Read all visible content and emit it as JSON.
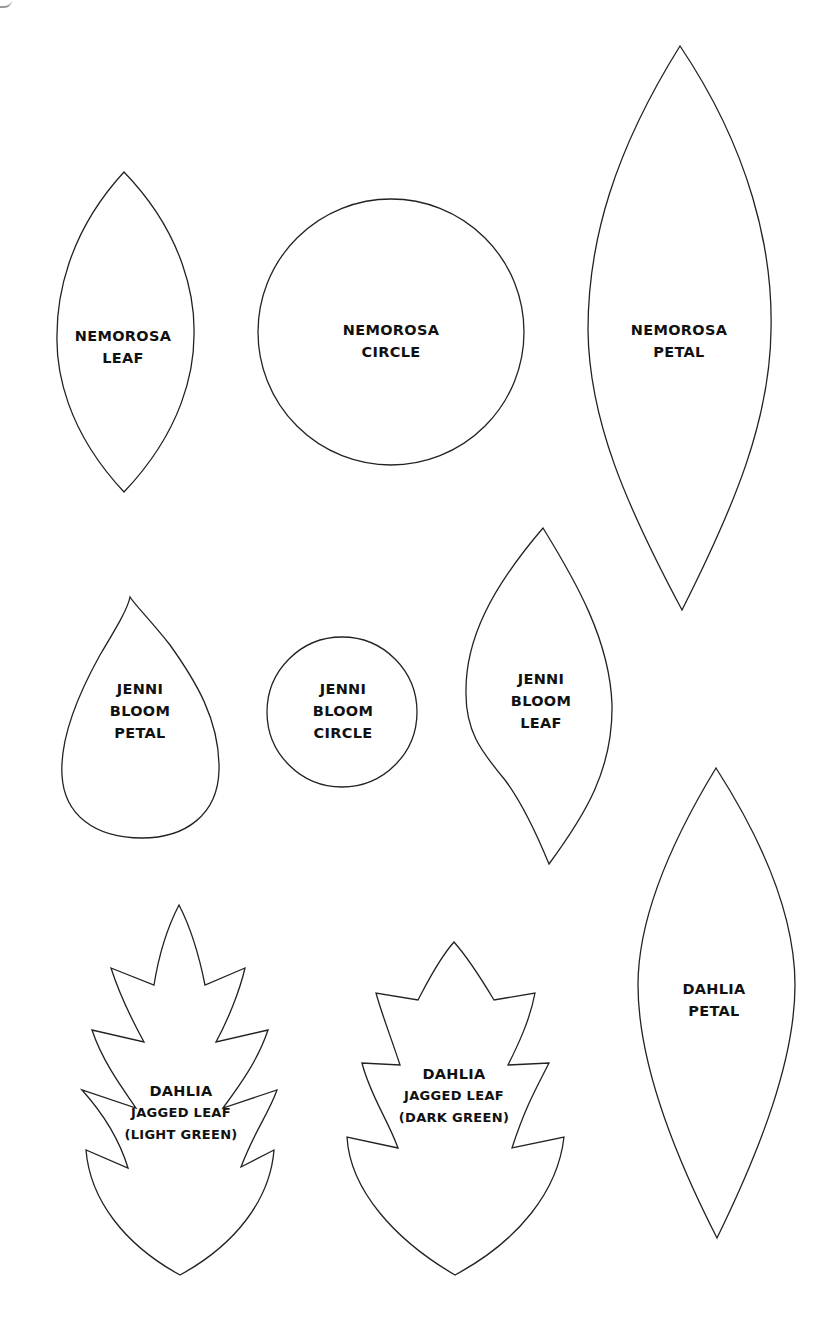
{
  "page": {
    "background": "#ffffff",
    "stroke_color": "#222222",
    "text_color": "#111111"
  },
  "templates": [
    {
      "id": "nemorosa-leaf",
      "shape": "pointed-oval",
      "lines": [
        "NEMOROSA",
        "LEAF"
      ]
    },
    {
      "id": "nemorosa-circle",
      "shape": "circle",
      "lines": [
        "NEMOROSA",
        "CIRCLE"
      ]
    },
    {
      "id": "nemorosa-petal",
      "shape": "pointed-oval",
      "lines": [
        "NEMOROSA",
        "PETAL"
      ]
    },
    {
      "id": "jenni-bloom-petal",
      "shape": "teardrop",
      "lines": [
        "JENNI",
        "BLOOM",
        "PETAL"
      ]
    },
    {
      "id": "jenni-bloom-circle",
      "shape": "circle",
      "lines": [
        "JENNI",
        "BLOOM",
        "CIRCLE"
      ]
    },
    {
      "id": "jenni-bloom-leaf",
      "shape": "asymmetric-leaf",
      "lines": [
        "JENNI",
        "BLOOM",
        "LEAF"
      ]
    },
    {
      "id": "dahlia-petal",
      "shape": "pointed-oval",
      "lines": [
        "DAHLIA",
        "PETAL"
      ]
    },
    {
      "id": "dahlia-jagged-leaf-light",
      "shape": "jagged-leaf",
      "lines": [
        "DAHLIA",
        "JAGGED LEAF",
        "(LIGHT GREEN)"
      ]
    },
    {
      "id": "dahlia-jagged-leaf-dark",
      "shape": "jagged-leaf",
      "lines": [
        "DAHLIA",
        "JAGGED LEAF",
        "(DARK GREEN)"
      ]
    }
  ]
}
